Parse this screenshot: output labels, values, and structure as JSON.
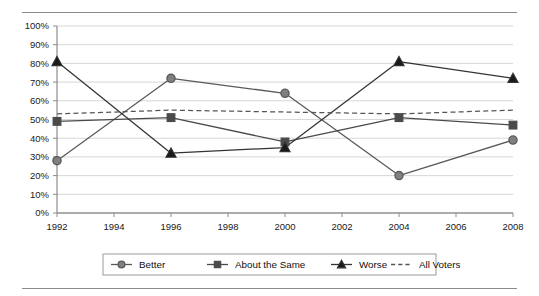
{
  "chart_data": {
    "type": "line",
    "title": "",
    "xlabel": "",
    "ylabel": "",
    "x": [
      1992,
      1996,
      2000,
      2004,
      2008
    ],
    "xlim": [
      1992,
      2008
    ],
    "ylim": [
      0,
      100
    ],
    "xticks": [
      "1992",
      "1994",
      "1996",
      "1998",
      "2000",
      "2002",
      "2004",
      "2006",
      "2008"
    ],
    "xtick_values": [
      1992,
      1994,
      1996,
      1998,
      2000,
      2002,
      2004,
      2006,
      2008
    ],
    "yticks": [
      "0%",
      "10%",
      "20%",
      "30%",
      "40%",
      "50%",
      "60%",
      "70%",
      "80%",
      "90%",
      "100%"
    ],
    "ytick_values": [
      0,
      10,
      20,
      30,
      40,
      50,
      60,
      70,
      80,
      90,
      100
    ],
    "grid": "horizontal",
    "legend_position": "bottom",
    "series": [
      {
        "name": "Better",
        "marker": "circle",
        "linestyle": "solid",
        "color": "#595959",
        "marker_fill": "#808080",
        "values": [
          28,
          72,
          64,
          20,
          39
        ]
      },
      {
        "name": "About the Same",
        "marker": "square",
        "linestyle": "solid",
        "color": "#4a4a4a",
        "marker_fill": "#4a4a4a",
        "values": [
          49,
          51,
          38,
          51,
          47
        ]
      },
      {
        "name": "Worse",
        "marker": "triangle",
        "linestyle": "solid",
        "color": "#333333",
        "marker_fill": "#1a1a1a",
        "values": [
          81,
          32,
          35,
          81,
          72
        ]
      },
      {
        "name": "All Voters",
        "marker": "none",
        "linestyle": "dashed",
        "color": "#555555",
        "marker_fill": "none",
        "values": [
          53,
          55,
          54,
          53,
          55
        ]
      }
    ]
  },
  "legend": {
    "entries": [
      {
        "label": "Better"
      },
      {
        "label": "About the Same"
      },
      {
        "label": "Worse"
      },
      {
        "label": "All Voters"
      }
    ]
  }
}
